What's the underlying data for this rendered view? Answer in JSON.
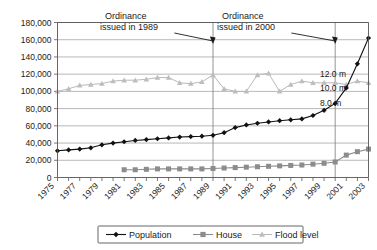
{
  "chart_data": {
    "type": "line",
    "title": "",
    "xlabel": "",
    "ylabel": "",
    "ylim": [
      0,
      180000
    ],
    "ytick_step": 20000,
    "grid": true,
    "legend_position": "bottom-center",
    "x": [
      1975,
      1976,
      1977,
      1978,
      1979,
      1980,
      1981,
      1982,
      1983,
      1984,
      1985,
      1986,
      1987,
      1988,
      1989,
      1990,
      1991,
      1992,
      1993,
      1994,
      1995,
      1996,
      1997,
      1998,
      1999,
      2000,
      2001,
      2002,
      2003
    ],
    "xtick_labels": [
      "1975",
      "1977",
      "1979",
      "1981",
      "1983",
      "1985",
      "1987",
      "1989",
      "1991",
      "1993",
      "1995",
      "1997",
      "1999",
      "2001",
      "2003"
    ],
    "ytick_labels": [
      "0",
      "20,000",
      "40,000",
      "60,000",
      "80,000",
      "100,000",
      "120,000",
      "140,000",
      "160,000",
      "180,000"
    ],
    "series": [
      {
        "name": "Population",
        "marker": "diamond",
        "color": "#111111",
        "values": [
          31000,
          32000,
          33000,
          34500,
          38000,
          40000,
          41500,
          43000,
          44000,
          45000,
          46000,
          47000,
          47500,
          48000,
          49000,
          52000,
          58000,
          61000,
          63000,
          64500,
          66000,
          67000,
          68000,
          72000,
          78000,
          86000,
          104000,
          132000,
          162000
        ]
      },
      {
        "name": "House",
        "marker": "square",
        "color": "#8c8c8c",
        "values": [
          null,
          null,
          null,
          null,
          null,
          null,
          9000,
          9000,
          9500,
          10000,
          10000,
          10000,
          10000,
          10000,
          10500,
          11000,
          11500,
          12000,
          12500,
          13000,
          13500,
          14000,
          14500,
          15500,
          16500,
          18000,
          26000,
          30000,
          33000
        ]
      },
      {
        "name": "Flood level",
        "marker": "triangle",
        "color": "#bdbdbd",
        "values": [
          100000,
          103000,
          107000,
          108000,
          109000,
          112000,
          113000,
          113000,
          114000,
          116000,
          116000,
          110000,
          109000,
          111000,
          119000,
          103000,
          100000,
          100000,
          119000,
          121000,
          100000,
          108000,
          112000,
          110000,
          110000,
          110000,
          108000,
          112000,
          110000
        ]
      }
    ],
    "annotations": [
      {
        "name": "ordinance-1989",
        "line1": "Ordinance",
        "line2": "issued in 1989",
        "target_year": 1989
      },
      {
        "name": "ordinance-2000",
        "line1": "Ordinance",
        "line2": "issued in 2000",
        "target_year": 2000
      }
    ],
    "level_labels": [
      {
        "text": "12.0 m",
        "value": 120000
      },
      {
        "text": "10.0 m",
        "value": 104000
      },
      {
        "text": "8.0 m",
        "value": 86000
      }
    ]
  }
}
